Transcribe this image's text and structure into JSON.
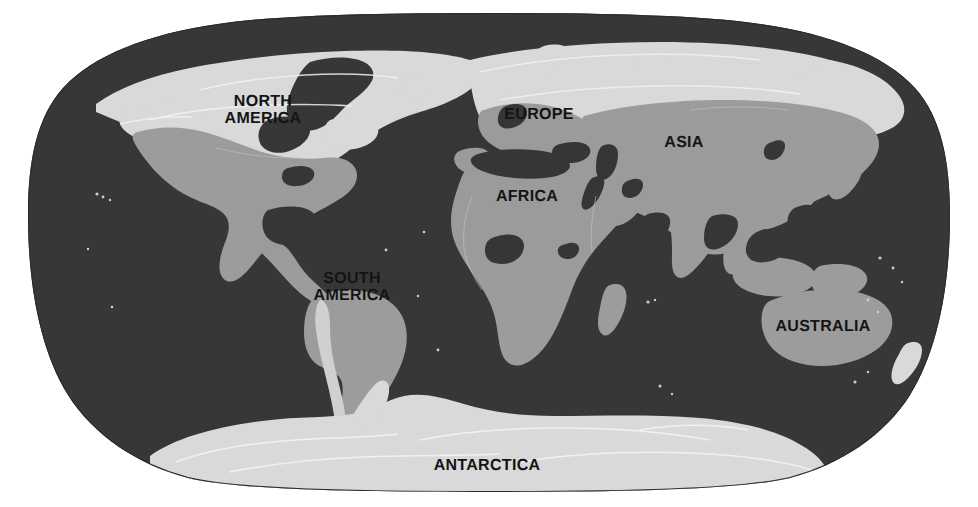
{
  "figure": {
    "kind": "world-map",
    "projection": "Robinson",
    "background_color": "#ffffff",
    "width": 978,
    "height": 507
  },
  "palette": {
    "ocean": "#373737",
    "land": "#9c9c9c",
    "ice_and_tundra": "#d9d9d9",
    "coastline_highlight": "#e8e8e8",
    "label_text": "#141414",
    "page_background": "#ffffff"
  },
  "legend_regions": [
    {
      "name": "ocean-and-deep-water",
      "color": "#373737"
    },
    {
      "name": "landmass",
      "color": "#9c9c9c"
    },
    {
      "name": "polar-ice-and-northern-latitudes",
      "color": "#d9d9d9"
    }
  ],
  "labels": [
    {
      "id": "north-america",
      "text": "NORTH\nAMERICA",
      "x": 263,
      "y": 110,
      "font_size": 16
    },
    {
      "id": "south-america",
      "text": "SOUTH\nAMERICA",
      "x": 352,
      "y": 287,
      "font_size": 16
    },
    {
      "id": "europe",
      "text": "EUROPE",
      "x": 539,
      "y": 115,
      "font_size": 16
    },
    {
      "id": "africa",
      "text": "AFRICA",
      "x": 527,
      "y": 197,
      "font_size": 16
    },
    {
      "id": "asia",
      "text": "ASIA",
      "x": 684,
      "y": 143,
      "font_size": 16
    },
    {
      "id": "australia",
      "text": "AUSTRALIA",
      "x": 823,
      "y": 327,
      "font_size": 16
    },
    {
      "id": "antarctica",
      "text": "ANTARCTICA",
      "x": 487,
      "y": 466,
      "font_size": 16
    }
  ],
  "continents": [
    {
      "name": "North America"
    },
    {
      "name": "South America"
    },
    {
      "name": "Europe"
    },
    {
      "name": "Africa"
    },
    {
      "name": "Asia"
    },
    {
      "name": "Australia"
    },
    {
      "name": "Antarctica"
    }
  ]
}
